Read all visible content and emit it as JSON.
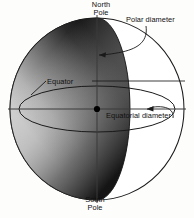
{
  "diagram": {
    "labels": {
      "north_pole_line1": "North",
      "north_pole_line2": "Pole",
      "south_pole_line1": "South",
      "south_pole_line2": "Pole",
      "polar_diameter": "Polar diameter",
      "equator": "Equator",
      "equatorial_diameter": "Equatorial diameter"
    },
    "colors": {
      "background": "#fdfdfc",
      "outline": "#1a1a1a",
      "crescent_dark": "#1c1c1c",
      "crescent_mid": "#6e6e6e",
      "crescent_light": "#b9b9b9",
      "sphere_fill": "#ffffff",
      "center_dot": "#000000",
      "text": "#101010"
    },
    "geometry": {
      "sphere_center_x": 97,
      "sphere_center_y": 109,
      "sphere_radius_x": 87,
      "sphere_radius_y": 91,
      "equator_ellipse_rx": 78,
      "equator_ellipse_ry": 23,
      "meridian_ellipse_rx": 33,
      "meridian_ellipse_ry": 91,
      "center_dot_radius": 3.1
    },
    "icon_names": {
      "sphere": "globe-sphere-icon",
      "polar_arrow": "arrow-pointer-icon",
      "equatorial_arrow": "arrow-pointer-icon",
      "center_dot": "center-point-icon"
    }
  }
}
